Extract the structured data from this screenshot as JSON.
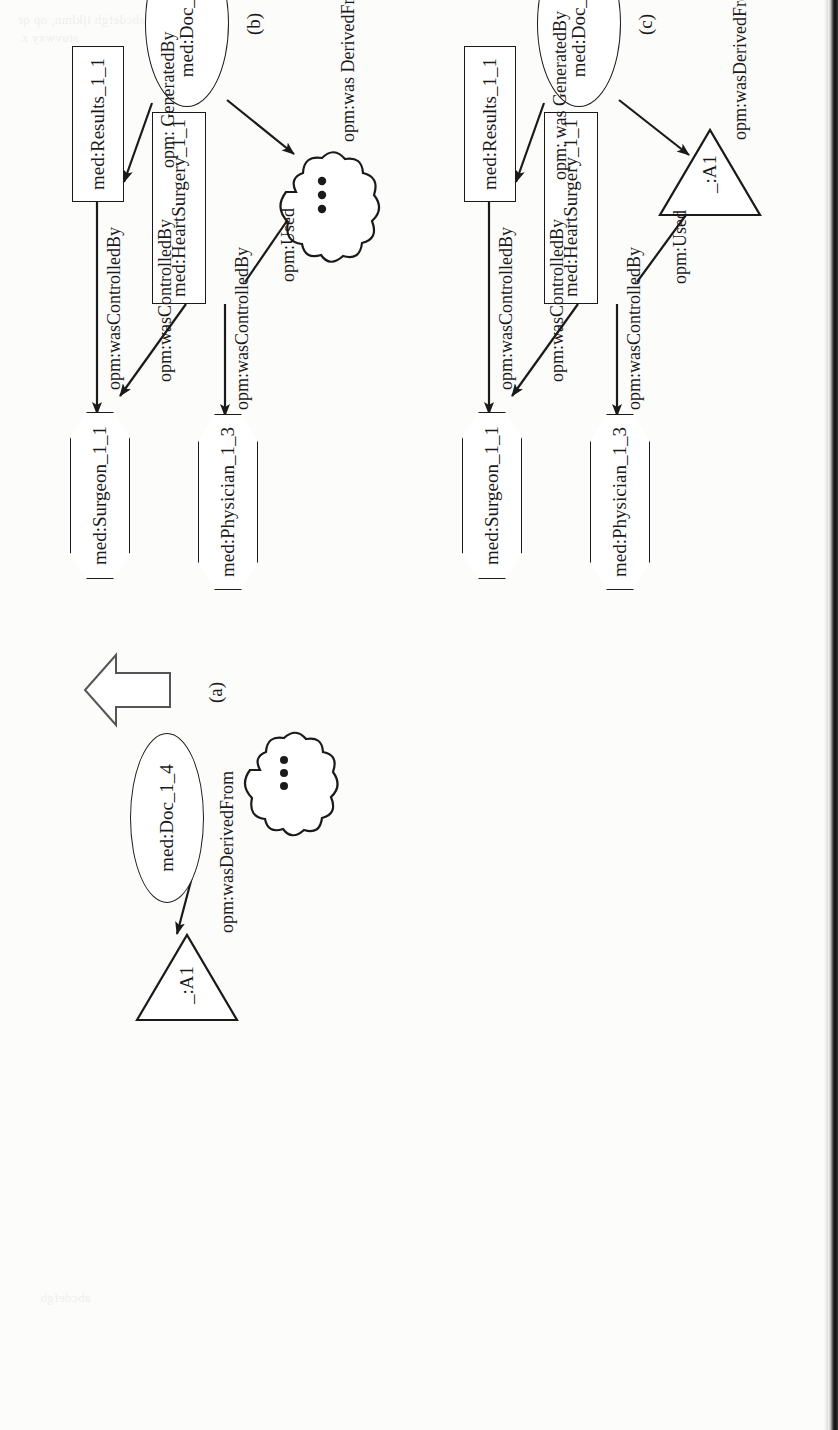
{
  "page": {
    "orientation": "rotated-90-ccw",
    "background_color": "#fcfcfa",
    "ink_color": "#1a1a1a",
    "scan_edge_color": "#111111",
    "ghost_text_1": "abcdefgh ijklmn, op qr",
    "ghost_text_2": "stuvwxy z.",
    "ghost_text_3": "abcdefgh"
  },
  "figure": {
    "subfigures": [
      {
        "id": "a",
        "caption": "(a)"
      },
      {
        "id": "b",
        "caption": "(b)"
      },
      {
        "id": "c",
        "caption": "(c)"
      }
    ]
  },
  "diagram_a": {
    "caption": "(a)",
    "nodes": {
      "triangle": "_:A1",
      "doc": "med:Doc_1_4"
    },
    "edges": {
      "derived": "opm:wasDerivedFrom"
    },
    "transform_arrow": "block-arrow-right"
  },
  "diagram_b": {
    "caption": "(b)",
    "nodes": {
      "physician": "med:Physician_1_3",
      "surgeon": "med:Surgeon_1_1",
      "heart_surgery": "med:HeartSurgery_1_1",
      "results": "med:Results_1_1",
      "doc": "med:Doc_1_4",
      "cloud": "…"
    },
    "edges": {
      "surgery_to_physician": "opm:wasControlledBy",
      "surgery_to_surgeon": "opm:wasControlledBy",
      "results_to_surgeon": "opm:wasControlledBy",
      "surgery_used_cloud": "opm:Used",
      "doc_generated_results": "opm: GeneratedBy",
      "doc_derived_cloud": "opm:was DerivedFrom"
    }
  },
  "diagram_c": {
    "caption": "(c)",
    "nodes": {
      "physician": "med:Physician_1_3",
      "surgeon": "med:Surgeon_1_1",
      "heart_surgery": "med:HeartSurgery_1_1",
      "results": "med:Results_1_1",
      "doc": "med:Doc_1_4",
      "triangle": "_:A1"
    },
    "edges": {
      "surgery_to_physician": "opm:wasControlledBy",
      "surgery_to_surgeon": "opm:wasControlledBy",
      "results_to_surgeon": "opm:wasControlledBy",
      "surgery_used_triangle": "opm:Used",
      "doc_generated_results": "opm: was GeneratedBy",
      "doc_derived_triangle": "opm:wasDerivedFrom"
    }
  }
}
